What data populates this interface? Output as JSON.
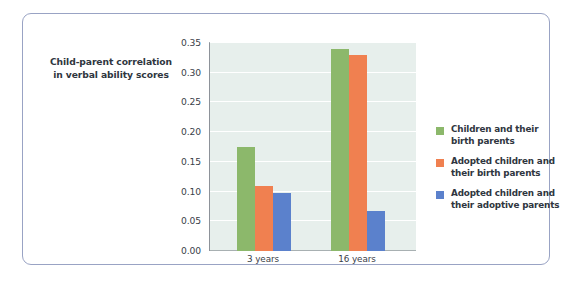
{
  "chart_data": {
    "type": "bar",
    "title": "",
    "xlabel": "",
    "ylabel": "Child-parent correlation in verbal ability scores",
    "ylabel_line1": "Child-parent correlation",
    "ylabel_line2": "in verbal ability scores",
    "categories": [
      "3 years",
      "16 years"
    ],
    "ylim": [
      0.0,
      0.35
    ],
    "ytick_values": [
      0.0,
      0.05,
      0.1,
      0.15,
      0.2,
      0.25,
      0.3,
      0.35
    ],
    "ytick_labels": [
      "0.00",
      "0.05",
      "0.10",
      "0.15",
      "0.20",
      "0.25",
      "0.30",
      "0.35"
    ],
    "grid": true,
    "grid_color": "#ffffff",
    "plot_background": "#e7efec",
    "legend_position": "right",
    "series": [
      {
        "name": "Children and their birth parents",
        "name_line1": "Children and their",
        "name_line2": "birth parents",
        "color": "#8cb86b",
        "values": [
          0.175,
          0.34
        ]
      },
      {
        "name": "Adopted children and their birth parents",
        "name_line1": "Adopted children and",
        "name_line2": "their birth parents",
        "color": "#f08050",
        "values": [
          0.11,
          0.33
        ]
      },
      {
        "name": "Adopted children and their adoptive parents",
        "name_line1": "Adopted children and",
        "name_line2": "their adoptive parents",
        "color": "#5b81cc",
        "values": [
          0.098,
          0.068
        ]
      }
    ]
  },
  "frame": {
    "border_color": "#99a3c4"
  }
}
